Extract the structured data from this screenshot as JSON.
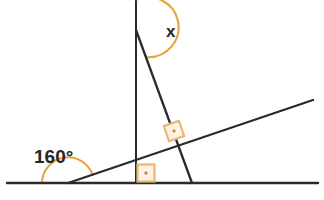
{
  "figure": {
    "type": "geometry-diagram",
    "background_color": "#ffffff",
    "width": 324,
    "height": 200
  },
  "colors": {
    "line_stroke": "#2b2b2b",
    "arc_stroke": "#e3a63e",
    "arc_stroke_light": "#f0c074",
    "right_angle_stroke": "#e8b877",
    "right_angle_fill": "#fdf3e4",
    "right_angle_dot": "#c98a3c",
    "label_text": "#262626"
  },
  "labels": {
    "unknown_angle": "x",
    "known_angle": "160°"
  },
  "lines": [
    {
      "name": "horizontal-baseline",
      "from": [
        7,
        183
      ],
      "to": [
        318,
        183
      ],
      "stroke_width": 2.2
    },
    {
      "name": "vertical-line",
      "from": [
        136,
        1
      ],
      "to": [
        136,
        183
      ],
      "stroke_width": 2.0
    },
    {
      "name": "rising-transversal",
      "from": [
        68,
        183
      ],
      "to": [
        313,
        100
      ],
      "stroke_width": 2.2
    },
    {
      "name": "descending-line",
      "from": [
        136,
        30
      ],
      "to": [
        192,
        183
      ],
      "stroke_width": 2.2
    }
  ],
  "arcs": [
    {
      "name": "reflex-angle-arc-x",
      "vertex": [
        136,
        30
      ],
      "radius": 30,
      "description": "reflex arc from upward vertical ray clockwise to descending line"
    },
    {
      "name": "angle-arc-160",
      "vertex": [
        68,
        183
      ],
      "radius": 26,
      "description": "arc from baseline-left around to rising transversal"
    }
  ],
  "right_angle_marks": [
    {
      "name": "right-angle-mark-transversal-intersection",
      "position": [
        174,
        131
      ],
      "size": 15,
      "rotation_deg": -18.7,
      "has_dot": true
    },
    {
      "name": "right-angle-mark-base-intersection",
      "position": [
        146,
        173
      ],
      "size": 16,
      "rotation_deg": 0,
      "has_dot": true
    }
  ],
  "label_positions": {
    "unknown_angle": [
      166,
      37
    ],
    "known_angle": [
      34,
      163
    ]
  }
}
